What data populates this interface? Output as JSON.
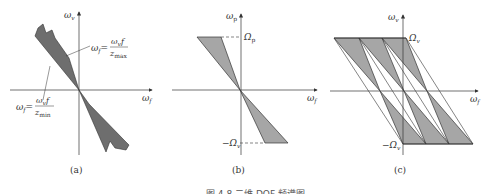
{
  "figure": {
    "caption": "图 4.8  二维 DOF 频谱图",
    "fill_color": "#a6a6a6",
    "dark_fill_color": "#6e6e6e",
    "line_color": "#333333"
  },
  "panels": [
    {
      "id": "a",
      "label": "(a)",
      "y_axis": "ωv",
      "x_axis": "ωf",
      "annotation_max": {
        "lhs": "ωf =",
        "num": "ωv f",
        "den": "zmax"
      },
      "annotation_min": {
        "lhs": "ωf =",
        "num": "ωv f",
        "den": "zmin"
      }
    },
    {
      "id": "b",
      "label": "(b)",
      "y_axis": "ωp",
      "x_axis": "ωf",
      "top_limit": "Ωp",
      "bottom_limit": "−Ωv"
    },
    {
      "id": "c",
      "label": "(c)",
      "y_axis": "ωv",
      "x_axis": "ωf",
      "top_limit": "Ωv",
      "bottom_limit": "−Ωv"
    }
  ]
}
